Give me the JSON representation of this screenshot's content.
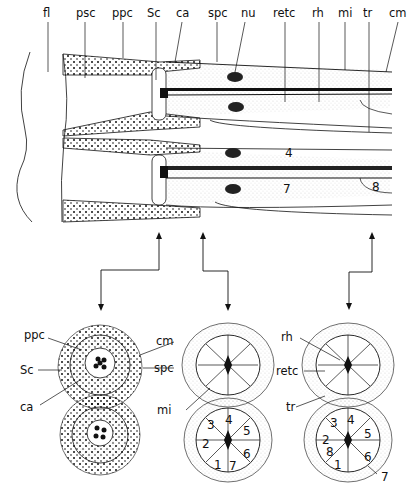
{
  "figure": {
    "type": "ommatidium schematic: longitudinal section with three cross sections",
    "longitudinal_section": {
      "labels": [
        "fl",
        "psc",
        "ppc",
        "Sc",
        "ca",
        "spc",
        "nu",
        "retc",
        "rh",
        "mi",
        "tr",
        "cm"
      ],
      "cell_numbers": [
        "4",
        "7",
        "8"
      ]
    },
    "cross_sections": [
      {
        "id": "distal",
        "labels": [
          "ppc",
          "Sc",
          "ca"
        ],
        "shared_label": "cm",
        "shared_label2": "spc"
      },
      {
        "id": "middle",
        "labels": [
          "mi"
        ],
        "cell_numbers": [
          "3",
          "4",
          "5",
          "2",
          "6",
          "1",
          "7"
        ]
      },
      {
        "id": "proximal",
        "labels": [
          "rh",
          "retc",
          "tr"
        ],
        "cell_numbers": [
          "3",
          "4",
          "5",
          "2",
          "8",
          "6",
          "1",
          "7"
        ]
      }
    ],
    "colors": {
      "ink": "#111111",
      "background": "#ffffff"
    }
  }
}
